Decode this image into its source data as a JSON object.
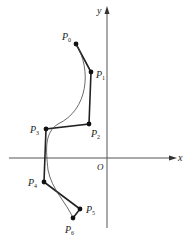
{
  "diagram": {
    "type": "bezier-control-polygon",
    "axes": {
      "x_label": "x",
      "y_label": "y",
      "origin_label": "O"
    },
    "control_points": [
      {
        "name": "P",
        "sub": "0",
        "px": [
          76,
          44
        ]
      },
      {
        "name": "P",
        "sub": "1",
        "px": [
          91,
          72
        ]
      },
      {
        "name": "P",
        "sub": "2",
        "px": [
          89,
          124
        ]
      },
      {
        "name": "P",
        "sub": "3",
        "px": [
          46,
          129
        ]
      },
      {
        "name": "P",
        "sub": "4",
        "px": [
          44,
          182
        ]
      },
      {
        "name": "P",
        "sub": "5",
        "px": [
          80,
          209
        ]
      },
      {
        "name": "P",
        "sub": "6",
        "px": [
          73,
          218
        ]
      }
    ],
    "colors": {
      "axis": "#555555",
      "polygon": "#222222",
      "curve": "#444444",
      "point": "#111111"
    }
  }
}
